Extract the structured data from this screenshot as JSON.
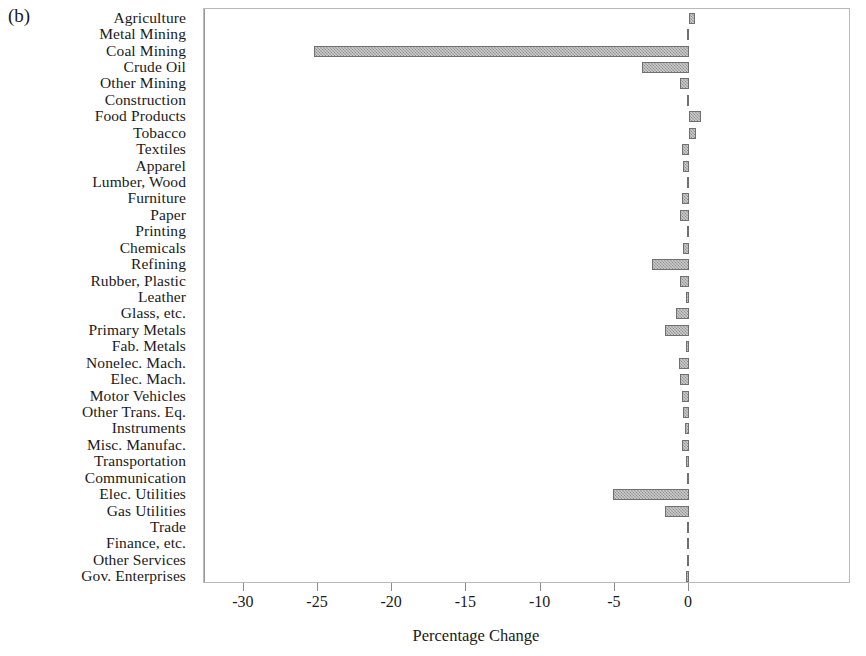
{
  "figure": {
    "panel_label": "(b)",
    "xlabel": "Percentage Change",
    "ylabel": ""
  },
  "chart_data": {
    "type": "bar",
    "orientation": "horizontal",
    "title": "",
    "panel": "(b)",
    "xlabel": "Percentage Change",
    "ylabel": "",
    "xlim": [
      -33.5,
      10.0
    ],
    "xticks": [
      -30,
      -25,
      -20,
      -15,
      -10,
      -5,
      0
    ],
    "xticklabels": [
      "-30",
      "-25",
      "-20",
      "-15",
      "-10",
      "-5",
      "0"
    ],
    "grid": false,
    "legend": false,
    "bar_color": "#8a8a8a",
    "bar_edge_color": "#6f6f6f",
    "categories": [
      "Agriculture",
      "Metal Mining",
      "Coal Mining",
      "Crude Oil",
      "Other Mining",
      "Construction",
      "Food Products",
      "Tobacco",
      "Textiles",
      "Apparel",
      "Lumber, Wood",
      "Furniture",
      "Paper",
      "Printing",
      "Chemicals",
      "Refining",
      "Rubber, Plastic",
      "Leather",
      "Glass, etc.",
      "Primary Metals",
      "Fab. Metals",
      "Nonelec. Mach.",
      "Elec. Mach.",
      "Motor Vehicles",
      "Other Trans. Eq.",
      "Instruments",
      "Misc. Manufac.",
      "Transportation",
      "Communication",
      "Elec. Utilities",
      "Gas Utilities",
      "Trade",
      "Finance, etc.",
      "Other Services",
      "Gov. Enterprises"
    ],
    "values": [
      0.4,
      -0.1,
      -25.3,
      -3.2,
      -0.6,
      -0.1,
      0.8,
      0.5,
      -0.5,
      -0.4,
      -0.1,
      -0.5,
      -0.6,
      -0.1,
      -0.4,
      -2.5,
      -0.6,
      -0.2,
      -0.9,
      -1.6,
      -0.2,
      -0.7,
      -0.6,
      -0.5,
      -0.4,
      -0.3,
      -0.5,
      -0.2,
      -0.1,
      -5.1,
      -1.6,
      -0.1,
      -0.05,
      -0.05,
      -0.2
    ]
  }
}
